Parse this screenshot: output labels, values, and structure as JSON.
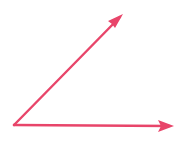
{
  "diagram": {
    "type": "angle",
    "color": "#e8456a",
    "vertex": {
      "x": 14,
      "y": 125
    },
    "rays": [
      {
        "name": "upper-ray",
        "to": {
          "x": 123,
          "y": 14
        }
      },
      {
        "name": "horizontal-ray",
        "to": {
          "x": 174,
          "y": 126
        }
      }
    ]
  }
}
